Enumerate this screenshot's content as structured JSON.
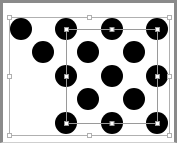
{
  "canvas": {
    "background": "#ffffff",
    "frame_color": "#8a8a8a",
    "circle_color": "#000000",
    "circle_radius": 11,
    "circles": [
      {
        "x": 21,
        "y": 29
      },
      {
        "x": 66,
        "y": 29
      },
      {
        "x": 112,
        "y": 29
      },
      {
        "x": 157,
        "y": 29
      },
      {
        "x": 43,
        "y": 52
      },
      {
        "x": 88,
        "y": 52
      },
      {
        "x": 134,
        "y": 52
      },
      {
        "x": 66,
        "y": 76
      },
      {
        "x": 112,
        "y": 76
      },
      {
        "x": 157,
        "y": 76
      },
      {
        "x": 88,
        "y": 99
      },
      {
        "x": 134,
        "y": 99
      },
      {
        "x": 66,
        "y": 123
      },
      {
        "x": 112,
        "y": 123
      },
      {
        "x": 157,
        "y": 123
      }
    ]
  },
  "selections": [
    {
      "name": "outer-selection",
      "x": 9,
      "y": 17,
      "w": 160,
      "h": 118,
      "color": "#b0b0b0"
    },
    {
      "name": "inner-selection",
      "x": 66,
      "y": 29,
      "w": 91,
      "h": 94,
      "color": "#9a9a9a"
    }
  ]
}
